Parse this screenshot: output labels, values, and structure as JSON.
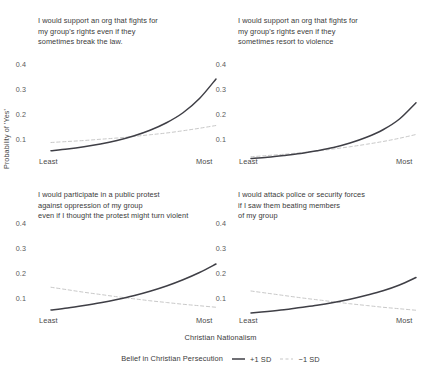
{
  "figure": {
    "y_axis_title": "Probability of 'Yes'",
    "x_axis_title": "Christian Nationalism"
  },
  "legend": {
    "title": "Belief in Christian Persecution",
    "entries": [
      {
        "label": "+1 SD",
        "style": "solid",
        "color": "#3f3f46"
      },
      {
        "label": "−1 SD",
        "style": "dashed",
        "color": "#c8c8c8"
      }
    ]
  },
  "chart_data": {
    "type": "line",
    "title": "",
    "xlabel": "Christian Nationalism",
    "ylabel": "Probability of 'Yes'",
    "x": [
      0,
      0.1,
      0.2,
      0.3,
      0.4,
      0.5,
      0.6,
      0.7,
      0.8,
      0.9,
      1
    ],
    "xtick_labels": [
      "Least",
      "Most"
    ],
    "grid": false,
    "legend_position": "bottom",
    "panels": [
      {
        "id": "support-org-break-law",
        "position": "top-left",
        "title": "I would support an org that fights for\nmy group's rights even if they\nsometimes break the law.",
        "ylim": [
          0,
          0.44
        ],
        "yticks": [
          0.1,
          0.2,
          0.3,
          0.4
        ],
        "ytick_labels": [
          "0.1",
          "0.2",
          "0.3",
          "0.4"
        ],
        "series": [
          {
            "name": "+1 SD",
            "style": "solid",
            "color": "#3f3f46",
            "values": [
              0.053,
              0.06,
              0.069,
              0.08,
              0.094,
              0.112,
              0.135,
              0.165,
              0.205,
              0.262,
              0.34
            ]
          },
          {
            "name": "−1 SD",
            "style": "dashed",
            "color": "#c8c8c8",
            "values": [
              0.086,
              0.09,
              0.094,
              0.099,
              0.104,
              0.11,
              0.117,
              0.124,
              0.133,
              0.143,
              0.154
            ]
          }
        ]
      },
      {
        "id": "support-org-violence",
        "position": "top-right",
        "title": "I would support an org that fights for\nmy group's rights even if they\nsometimes resort to violence",
        "ylim": [
          0,
          0.44
        ],
        "yticks": [
          0.1,
          0.2,
          0.3,
          0.4
        ],
        "ytick_labels": [
          "0.1",
          "0.2",
          "0.3",
          "0.4"
        ],
        "series": [
          {
            "name": "+1 SD",
            "style": "solid",
            "color": "#3f3f46",
            "values": [
              0.022,
              0.027,
              0.034,
              0.042,
              0.053,
              0.066,
              0.084,
              0.107,
              0.137,
              0.18,
              0.245
            ]
          },
          {
            "name": "−1 SD",
            "style": "dashed",
            "color": "#c8c8c8",
            "values": [
              0.029,
              0.034,
              0.039,
              0.045,
              0.052,
              0.06,
              0.069,
              0.079,
              0.09,
              0.103,
              0.118
            ]
          }
        ]
      },
      {
        "id": "protest-turn-violent",
        "position": "bottom-left",
        "title": "I would participate in a public protest\nagainst oppression of my group\neven if I thought the protest might turn violent",
        "ylim": [
          0,
          0.44
        ],
        "yticks": [
          0.1,
          0.2,
          0.3,
          0.4
        ],
        "ytick_labels": [
          "0.1",
          "0.2",
          "0.3",
          "0.4"
        ],
        "series": [
          {
            "name": "+1 SD",
            "style": "solid",
            "color": "#3f3f46",
            "values": [
              0.052,
              0.06,
              0.07,
              0.081,
              0.094,
              0.109,
              0.127,
              0.148,
              0.173,
              0.202,
              0.236
            ]
          },
          {
            "name": "−1 SD",
            "style": "dashed",
            "color": "#c8c8c8",
            "values": [
              0.143,
              0.133,
              0.123,
              0.114,
              0.105,
              0.097,
              0.089,
              0.082,
              0.075,
              0.069,
              0.063
            ]
          }
        ]
      },
      {
        "id": "attack-police",
        "position": "bottom-right",
        "title": "I would attack police or security forces\nif I saw them beating members\nof my group",
        "ylim": [
          0,
          0.44
        ],
        "yticks": [
          0.1,
          0.2,
          0.3,
          0.4
        ],
        "ytick_labels": [
          "0.1",
          "0.2",
          "0.3",
          "0.4"
        ],
        "series": [
          {
            "name": "+1 SD",
            "style": "solid",
            "color": "#3f3f46",
            "values": [
              0.04,
              0.046,
              0.053,
              0.062,
              0.071,
              0.082,
              0.095,
              0.111,
              0.129,
              0.152,
              0.182
            ]
          },
          {
            "name": "−1 SD",
            "style": "dashed",
            "color": "#c8c8c8",
            "values": [
              0.128,
              0.119,
              0.11,
              0.101,
              0.093,
              0.085,
              0.077,
              0.07,
              0.063,
              0.057,
              0.051
            ]
          }
        ]
      }
    ]
  }
}
